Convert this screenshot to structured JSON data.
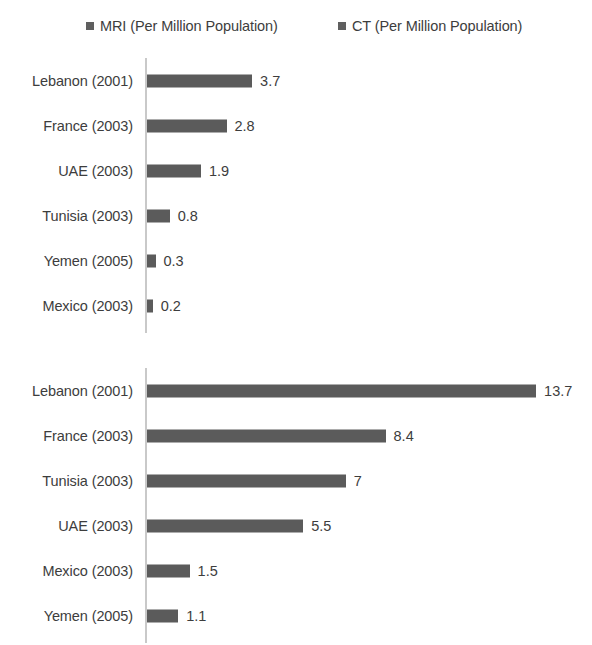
{
  "legend": {
    "position": "top",
    "entries": [
      {
        "name": "legend-mri",
        "label": "MRI (Per Million Population)",
        "color": "#5f5f5f"
      },
      {
        "name": "legend-ct",
        "label": "CT (Per Million Population)",
        "color": "#5f5f5f"
      }
    ]
  },
  "chart_data": {
    "type": "bar",
    "orientation": "horizontal",
    "title": "",
    "xlabel": "",
    "ylabel": "",
    "grid": false,
    "legend_position": "top",
    "axis_max": 15.5,
    "panels": [
      {
        "name": "mri-panel",
        "series_name": "MRI (Per Million Population)",
        "color": "#5b5b5b",
        "categories": [
          "Lebanon (2001)",
          "France (2003)",
          "UAE (2003)",
          "Tunisia (2003)",
          "Yemen (2005)",
          "Mexico (2003)"
        ],
        "values": [
          3.7,
          2.8,
          1.9,
          0.8,
          0.3,
          0.2
        ],
        "value_labels": [
          "3.7",
          "2.8",
          "1.9",
          "0.8",
          "0.3",
          "0.2"
        ]
      },
      {
        "name": "ct-panel",
        "series_name": "CT (Per Million Population)",
        "color": "#5b5b5b",
        "categories": [
          "Lebanon (2001)",
          "France (2003)",
          "Tunisia (2003)",
          "UAE (2003)",
          "Mexico (2003)",
          "Yemen (2005)"
        ],
        "values": [
          13.7,
          8.4,
          7,
          5.5,
          1.5,
          1.1
        ],
        "value_labels": [
          "13.7",
          "8.4",
          "7",
          "5.5",
          "1.5",
          "1.1"
        ]
      }
    ]
  }
}
